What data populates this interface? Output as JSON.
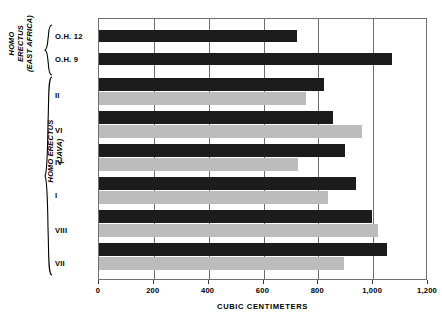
{
  "chart_data": {
    "type": "bar",
    "orientation": "horizontal",
    "title": "",
    "xlabel": "CUBIC CENTIMETERS",
    "ylabel": "",
    "xlim": [
      0,
      1200
    ],
    "xticks": [
      0,
      200,
      400,
      600,
      800,
      1000,
      1200
    ],
    "xtick_labels": [
      "0",
      "200",
      "400",
      "600",
      "800",
      "1,000",
      "1,200"
    ],
    "grid": "vertical",
    "legend": "none",
    "categories": [
      "O.H. 12",
      "O.H. 9",
      "II",
      "VI",
      "IV",
      "I",
      "VIII",
      "VII"
    ],
    "series": [
      {
        "name": "dark",
        "color": "#1c1c1c",
        "values": [
          724,
          1069,
          822,
          855,
          898,
          938,
          996,
          1051
        ]
      },
      {
        "name": "light",
        "color": "#bcbcbc",
        "values": [
          null,
          null,
          756,
          960,
          727,
          836,
          1018,
          895
        ]
      }
    ],
    "groups": [
      {
        "label": "HOMO ERECTUS\n(EAST AFRICA)",
        "categories": [
          "O.H. 12",
          "O.H. 9"
        ]
      },
      {
        "label": "HOMO ERECTUS\n(JAVA)",
        "categories": [
          "II",
          "VI",
          "IV",
          "I",
          "VIII",
          "VII"
        ]
      }
    ]
  },
  "axis": {
    "title": "CUBIC CENTIMETERS",
    "tick_labels": [
      "0",
      "200",
      "400",
      "600",
      "800",
      "1,000",
      "1,200"
    ]
  },
  "groups": {
    "east_africa": {
      "title": "HOMO ERECTUS\n(EAST AFRICA)"
    },
    "java": {
      "title": "HOMO ERECTUS\n(JAVA)"
    }
  },
  "specimens": [
    {
      "label": "O.H. 12"
    },
    {
      "label": "O.H. 9"
    },
    {
      "label": "II"
    },
    {
      "label": "VI"
    },
    {
      "label": "IV"
    },
    {
      "label": "I"
    },
    {
      "label": "VIII"
    },
    {
      "label": "VII"
    }
  ],
  "colors": {
    "dark_bar": "#1c1c1c",
    "light_bar": "#bcbcbc",
    "grid": "#6f6f6f",
    "background": "#ffffff"
  }
}
